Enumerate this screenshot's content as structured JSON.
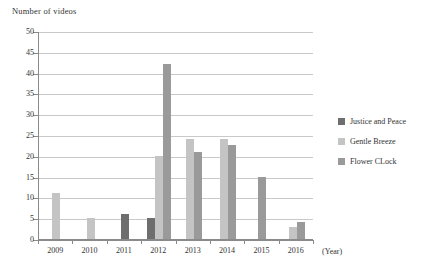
{
  "chart_data": {
    "type": "bar",
    "title": "Number of videos",
    "xlabel": "(Year)",
    "ylabel": "Number of videos",
    "ylim": [
      0,
      50
    ],
    "ytick_step": 5,
    "yticks": [
      "50",
      "45",
      "40",
      "35",
      "30",
      "25",
      "20",
      "15",
      "10",
      "5",
      "0"
    ],
    "grid": true,
    "legend_position": "right",
    "categories": [
      "2009",
      "2010",
      "2011",
      "2012",
      "2013",
      "2014",
      "2015",
      "2016"
    ],
    "series": [
      {
        "name": "Justice and Peace",
        "color": "#6e6e6e",
        "values": [
          0,
          0,
          6,
          5,
          0,
          0,
          0,
          0
        ]
      },
      {
        "name": "Gentle Breeze",
        "color": "#c4c4c4",
        "values": [
          11,
          5,
          0,
          20,
          24,
          24,
          0,
          3
        ]
      },
      {
        "name": "Flower CLock",
        "color": "#9a9a9a",
        "values": [
          0,
          0,
          0,
          42,
          21,
          22.5,
          15,
          4
        ]
      }
    ]
  },
  "axis": {
    "year_caption": "(Year)"
  }
}
